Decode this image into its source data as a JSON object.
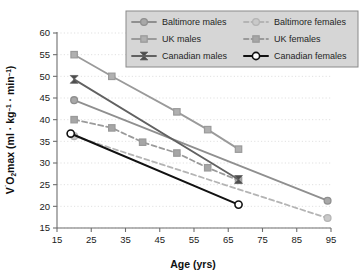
{
  "chart_data": {
    "type": "line",
    "title": "",
    "xlabel": "Age (yrs)",
    "ylabel": "VO2max (ml · kg⁻¹ · min⁻¹)",
    "ylabel_parts": {
      "v": "V",
      "dot": "˙",
      "o": "O",
      "two": "2",
      "max": "max (ml · kg",
      "exp1": "–1",
      "mid": " · min",
      "exp2": "–1",
      "close": ")"
    },
    "xlim": [
      15,
      95
    ],
    "ylim": [
      15,
      60
    ],
    "xticks": [
      15,
      25,
      35,
      45,
      55,
      65,
      75,
      85,
      95
    ],
    "yticks": [
      15,
      20,
      25,
      30,
      35,
      40,
      45,
      50,
      55,
      60
    ],
    "grid": true,
    "grid_style": "dotted",
    "legend_position": "top-center",
    "legend_columns": 2,
    "series": [
      {
        "name": "Baltimore males",
        "color": "#8f8f8f",
        "marker": "circle",
        "marker_fill": "#a8a8a8",
        "line_style": "solid",
        "points": [
          [
            20,
            44.5
          ],
          [
            94,
            21.3
          ]
        ]
      },
      {
        "name": "Baltimore females",
        "color": "#b4b4b4",
        "marker": "circle",
        "marker_fill": "#c9c9c9",
        "line_style": "dashed",
        "points": [
          [
            20,
            36.2
          ],
          [
            94,
            17.3
          ]
        ]
      },
      {
        "name": "UK males",
        "color": "#9a9a9a",
        "marker": "square",
        "marker_fill": "#b0b0b0",
        "line_style": "solid",
        "points": [
          [
            20,
            55.0
          ],
          [
            31,
            50.0
          ],
          [
            50,
            41.8
          ],
          [
            59,
            37.7
          ],
          [
            68,
            33.2
          ]
        ]
      },
      {
        "name": "UK females",
        "color": "#9a9a9a",
        "marker": "square",
        "marker_fill": "#a6a6a6",
        "line_style": "dashed",
        "points": [
          [
            20,
            40.0
          ],
          [
            31,
            38.1
          ],
          [
            40,
            34.8
          ],
          [
            50,
            32.3
          ],
          [
            59,
            28.9
          ],
          [
            68,
            26.0
          ]
        ]
      },
      {
        "name": "Canadian males",
        "color": "#616161",
        "marker": "bowtie",
        "marker_fill": "#4d4d4d",
        "line_style": "solid",
        "points": [
          [
            20,
            49.3
          ],
          [
            68,
            26.2
          ]
        ]
      },
      {
        "name": "Canadian females",
        "color": "#111111",
        "marker": "open-circle",
        "marker_fill": "#ffffff",
        "line_style": "solid",
        "points": [
          [
            19,
            36.8
          ],
          [
            68,
            20.4
          ]
        ]
      }
    ]
  },
  "legend": {
    "background": "#d6d6d6",
    "border": "#8a8a8a",
    "items": [
      {
        "label": "Baltimore males"
      },
      {
        "label": "Baltimore females"
      },
      {
        "label": "UK males"
      },
      {
        "label": "UK females"
      },
      {
        "label": "Canadian males"
      },
      {
        "label": "Canadian females"
      }
    ]
  },
  "colors": {
    "axis": "#6e6e6e",
    "grid": "#d9d9d9",
    "text": "#1a1a1a",
    "background": "#ffffff"
  }
}
